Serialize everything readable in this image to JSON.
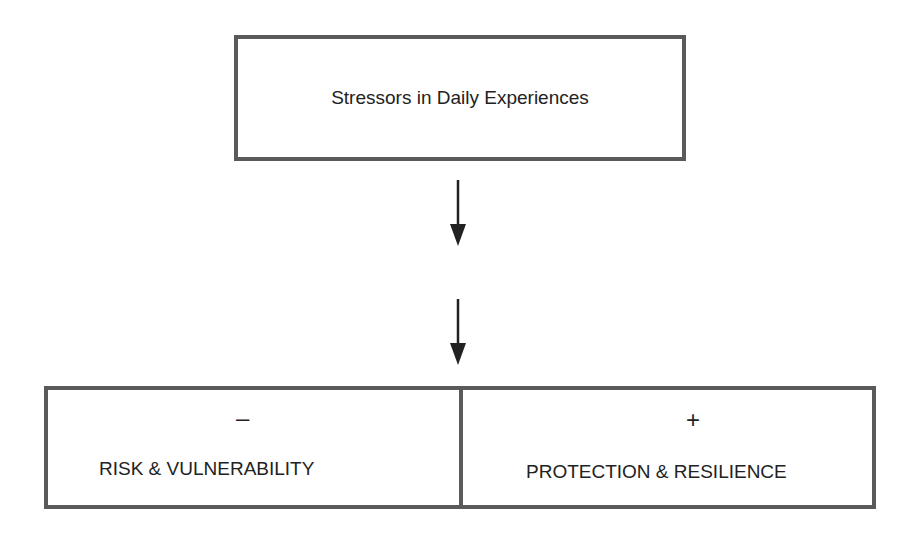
{
  "diagram": {
    "top_box": {
      "label": "Stressors in Daily Experiences"
    },
    "arrows": [
      {
        "direction": "down",
        "from": "top_box",
        "to": "middle"
      },
      {
        "direction": "down",
        "from": "middle",
        "to": "bottom_box"
      }
    ],
    "bottom_box": {
      "left": {
        "sign": "–",
        "label": "RISK & VULNERABILITY"
      },
      "right": {
        "sign": "+",
        "label": "PROTECTION & RESILIENCE"
      }
    },
    "colors": {
      "border": "#5a5a5a",
      "text": "#222222",
      "background": "#ffffff"
    }
  }
}
